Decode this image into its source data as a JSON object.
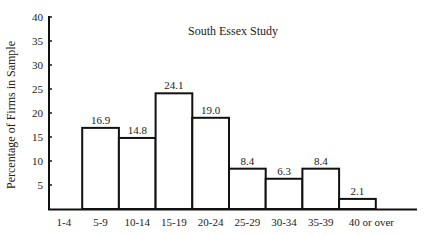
{
  "chart_data": {
    "type": "bar",
    "title": "South Essex Study",
    "xlabel": "",
    "ylabel": "Percentage of Firms in Sample",
    "ylim": [
      0,
      40
    ],
    "yticks": [
      5,
      10,
      15,
      20,
      25,
      30,
      35,
      40
    ],
    "grid": false,
    "legend": null,
    "categories": [
      "1-4",
      "5-9",
      "10-14",
      "15-19",
      "20-24",
      "25-29",
      "30-34",
      "35-39",
      "40 or over"
    ],
    "values": [
      0,
      16.9,
      14.8,
      24.1,
      19.0,
      8.4,
      6.3,
      8.4,
      2.1
    ],
    "value_labels": [
      "",
      "16.9",
      "14.8",
      "24.1",
      "19.0",
      "8.4",
      "6.3",
      "8.4",
      "2.1"
    ]
  }
}
